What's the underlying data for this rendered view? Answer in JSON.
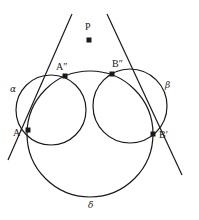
{
  "diagram": {
    "stroke_color": "#1a1a1a",
    "points": {
      "P": {
        "label": "P",
        "x": 89,
        "y": 40
      },
      "A2": {
        "label": "A″",
        "x": 65,
        "y": 76
      },
      "B2": {
        "label": "B″",
        "x": 112,
        "y": 74
      },
      "A1": {
        "label": "A′",
        "x": 28,
        "y": 130
      },
      "B1": {
        "label": "B′",
        "x": 153,
        "y": 134
      }
    },
    "circles": {
      "alpha": {
        "label": "α",
        "cx": 51,
        "cy": 110,
        "r": 35
      },
      "beta": {
        "label": "β",
        "cx": 130,
        "cy": 106,
        "r": 37
      },
      "delta": {
        "label": "δ",
        "cx": 90,
        "cy": 134,
        "r": 63
      }
    },
    "lines": [
      {
        "name": "line-through-A",
        "x1": 72,
        "y1": 14,
        "x2": 8,
        "y2": 160
      },
      {
        "name": "line-through-B",
        "x1": 107,
        "y1": 14,
        "x2": 182,
        "y2": 175
      }
    ]
  }
}
